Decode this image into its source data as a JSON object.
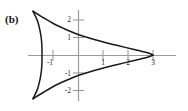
{
  "figure": {
    "panel_label": "(b)",
    "axis_color": "#9a9a9a",
    "curve_color": "#1a1a1a",
    "label_color": "#2b2b2b",
    "background": "#ffffff"
  },
  "axes": {
    "x_ticks": [
      {
        "value": -1,
        "label": "-1"
      },
      {
        "value": 1,
        "label": "1"
      },
      {
        "value": 2,
        "label": "2"
      },
      {
        "value": 3,
        "label": "3"
      }
    ],
    "y_ticks": [
      {
        "value": 2,
        "label": "2"
      },
      {
        "value": 1,
        "label": "1"
      },
      {
        "value": -1,
        "label": "-1"
      },
      {
        "value": -2,
        "label": "-2"
      }
    ],
    "xlim": [
      -2.4,
      3.6
    ],
    "ylim": [
      -3.1,
      3.1
    ],
    "origin_px": {
      "x": 78,
      "y": 55
    },
    "unit_px": {
      "x": 25,
      "y": 17.5
    }
  },
  "chart_data": {
    "type": "line",
    "title": "",
    "xlabel": "",
    "ylabel": "",
    "xlim": [
      -2.4,
      3.6
    ],
    "ylim": [
      -3.1,
      3.1
    ],
    "grid": false,
    "legend": null,
    "cusps": [
      {
        "x": -1.8,
        "y": 2.5
      },
      {
        "x": -1.8,
        "y": -2.5
      },
      {
        "x": 3.0,
        "y": 0.0
      }
    ],
    "series": [
      {
        "name": "upper-branch",
        "points": [
          [
            -1.8,
            2.5
          ],
          [
            -1.35,
            2.1
          ],
          [
            -0.95,
            1.77
          ],
          [
            -0.55,
            1.5
          ],
          [
            -0.15,
            1.26
          ],
          [
            0.25,
            1.06
          ],
          [
            0.65,
            0.89
          ],
          [
            1.05,
            0.73
          ],
          [
            1.45,
            0.59
          ],
          [
            1.85,
            0.45
          ],
          [
            2.2,
            0.33
          ],
          [
            2.5,
            0.23
          ],
          [
            2.75,
            0.14
          ],
          [
            2.92,
            0.06
          ],
          [
            3.0,
            0.0
          ]
        ]
      },
      {
        "name": "lower-branch",
        "points": [
          [
            -1.8,
            -2.5
          ],
          [
            -1.35,
            -2.1
          ],
          [
            -0.95,
            -1.77
          ],
          [
            -0.55,
            -1.5
          ],
          [
            -0.15,
            -1.26
          ],
          [
            0.25,
            -1.06
          ],
          [
            0.65,
            -0.89
          ],
          [
            1.05,
            -0.73
          ],
          [
            1.45,
            -0.59
          ],
          [
            1.85,
            -0.45
          ],
          [
            2.2,
            -0.33
          ],
          [
            2.5,
            -0.23
          ],
          [
            2.75,
            -0.14
          ],
          [
            2.92,
            -0.06
          ],
          [
            3.0,
            0.0
          ]
        ]
      },
      {
        "name": "left-arc",
        "points": [
          [
            -1.8,
            2.5
          ],
          [
            -1.62,
            1.95
          ],
          [
            -1.52,
            1.4
          ],
          [
            -1.46,
            0.85
          ],
          [
            -1.44,
            0.3
          ],
          [
            -1.44,
            0.0
          ],
          [
            -1.44,
            -0.3
          ],
          [
            -1.46,
            -0.85
          ],
          [
            -1.52,
            -1.4
          ],
          [
            -1.62,
            -1.95
          ],
          [
            -1.8,
            -2.5
          ]
        ]
      }
    ]
  }
}
